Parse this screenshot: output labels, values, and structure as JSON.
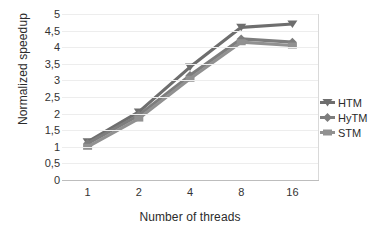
{
  "chart_data": {
    "type": "line",
    "title": "",
    "xlabel": "Number of threads",
    "ylabel": "Normalized speedup",
    "categories": [
      "1",
      "2",
      "4",
      "8",
      "16"
    ],
    "ylim": [
      0,
      5
    ],
    "ytick_labels": [
      "0",
      "0,5",
      "1",
      "1,5",
      "2",
      "2,5",
      "3",
      "3,5",
      "4",
      "4,5",
      "5"
    ],
    "ytick_values": [
      0,
      0.5,
      1,
      1.5,
      2,
      2.5,
      3,
      3.5,
      4,
      4.5,
      5
    ],
    "grid": true,
    "legend_position": "right",
    "series": [
      {
        "name": "HTM",
        "values": [
          1.15,
          2.05,
          3.4,
          4.6,
          4.7
        ],
        "color": "#6e6e6e",
        "marker": "triangle-down"
      },
      {
        "name": "HyTM",
        "values": [
          1.1,
          1.95,
          3.15,
          4.25,
          4.15
        ],
        "color": "#7d7d7d",
        "marker": "diamond"
      },
      {
        "name": "STM",
        "values": [
          1.0,
          1.85,
          3.05,
          4.15,
          4.05
        ],
        "color": "#919191",
        "marker": "bar"
      }
    ]
  },
  "axes": {
    "y_title": "Normalized speedup",
    "x_title": "Number of threads"
  },
  "legend": {
    "items": [
      {
        "label": "HTM"
      },
      {
        "label": "HyTM"
      },
      {
        "label": "STM"
      }
    ]
  },
  "colors": {
    "series_1": "#6e6e6e",
    "series_2": "#7d7d7d",
    "series_3": "#919191",
    "grid": "#ededed",
    "axis": "#bdbdbd",
    "text": "#2b2b2b"
  }
}
